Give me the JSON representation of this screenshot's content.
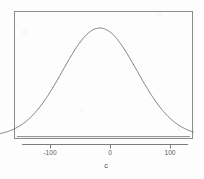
{
  "figure": {
    "width": 204,
    "height": 179,
    "background_color": "#fdfdfd",
    "frame_color": "#8c8c8c",
    "curve_color": "#6f6f6f",
    "axis_color": "#7d7d7d",
    "text_color": "#5d5d5d"
  },
  "chart_data": {
    "type": "line",
    "title": "",
    "subtitle": "",
    "xlabel": "c",
    "ylabel": "",
    "grid": false,
    "legend": null,
    "xlim": [
      -184,
      139
    ],
    "ylim": [
      0,
      0.0069
    ],
    "xticks": [
      -100,
      0,
      100
    ],
    "xticklabels": [
      "-100",
      "0",
      "100"
    ],
    "yticks": [],
    "yticklabels": [],
    "annotations": [],
    "series": [
      {
        "name": "density",
        "kind": "normal density curve",
        "mean": -17,
        "sd": 62,
        "peak_x": -17,
        "peak_y": 0.00643,
        "x": [
          -184,
          -170,
          -160,
          -150,
          -140,
          -130,
          -120,
          -110,
          -100,
          -90,
          -80,
          -70,
          -60,
          -50,
          -40,
          -30,
          -20,
          -10,
          0,
          10,
          20,
          30,
          40,
          50,
          60,
          70,
          80,
          90,
          100,
          110,
          120,
          130,
          139
        ],
        "y": [
          1e-05,
          4e-05,
          8e-05,
          0.00017,
          0.00033,
          0.00059,
          0.00101,
          0.00161,
          0.00243,
          0.00345,
          0.0046,
          0.00572,
          0.00662,
          0.00713,
          0.00713,
          0.00662,
          0.00572,
          0.0046,
          0.00345,
          0.00243,
          0.00161,
          0.00101,
          0.00059,
          0.00033,
          0.00017,
          8e-05,
          4e-05,
          2e-05,
          1e-05,
          3e-06,
          1e-06,
          4e-07,
          2e-07
        ]
      }
    ]
  },
  "axis": {
    "x_axis_label": "c",
    "tick_labels": [
      "-100",
      "0",
      "100"
    ]
  }
}
